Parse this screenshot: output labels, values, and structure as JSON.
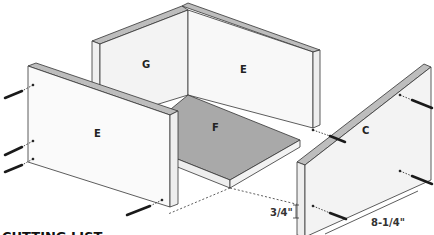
{
  "diagram": {
    "type": "exploded isometric assembly",
    "parts": [
      {
        "id": "G",
        "label": "G",
        "role": "back-left panel"
      },
      {
        "id": "E_back",
        "label": "E",
        "role": "back-right panel"
      },
      {
        "id": "E_front",
        "label": "E",
        "role": "front-left panel"
      },
      {
        "id": "F",
        "label": "F",
        "role": "bottom panel"
      },
      {
        "id": "C",
        "label": "C",
        "role": "right side panel"
      }
    ],
    "dimensions": {
      "thickness": "3/4\"",
      "depth": "8-1/4\""
    },
    "section_heading": "CUTTING LIST",
    "colors": {
      "panel_face": "#f4f4f4",
      "panel_edge": "#b9b9b9",
      "floor": "#a9a9a9",
      "outline": "#333333",
      "screw": "#1a1a1a"
    }
  }
}
